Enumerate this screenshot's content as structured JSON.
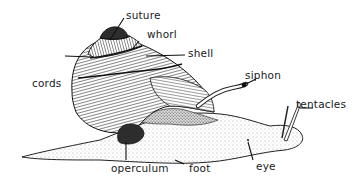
{
  "diagram": {
    "labels": {
      "suture": "suture",
      "whorl": "whorl",
      "shell": "shell",
      "cords": "cords",
      "siphon": "siphon",
      "tentacles": "tentacles",
      "operculum": "operculum",
      "foot": "foot",
      "eye": "eye"
    }
  }
}
